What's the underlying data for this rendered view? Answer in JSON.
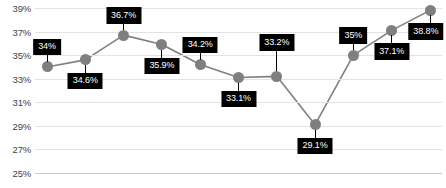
{
  "chart_data": {
    "type": "line",
    "title": "",
    "xlabel": "",
    "ylabel": "",
    "ylim": [
      25,
      39
    ],
    "grid": true,
    "legend": "none",
    "yticks": [
      "39%",
      "37%",
      "35%",
      "33%",
      "31%",
      "29%",
      "27%",
      "25%"
    ],
    "ytick_values": [
      39,
      37,
      35,
      33,
      31,
      29,
      27,
      25
    ],
    "categories": [
      "1",
      "2",
      "3",
      "4",
      "5",
      "6",
      "7",
      "8",
      "9",
      "10",
      "11"
    ],
    "values": [
      34,
      34.6,
      36.7,
      35.9,
      34.2,
      33.1,
      33.2,
      29.1,
      35,
      37.1,
      38.8
    ],
    "data_labels": [
      "34%",
      "34.6%",
      "36.7%",
      "35.9%",
      "34.2%",
      "33.1%",
      "33.2%",
      "29.1%",
      "35%",
      "37.1%",
      "38.8%"
    ],
    "label_placement": [
      "above",
      "below",
      "above",
      "below",
      "above",
      "below",
      "above-far",
      "below",
      "above",
      "below",
      "above"
    ],
    "colors": {
      "line": "#7f7f7f",
      "marker": "#7f7f7f",
      "label_background": "#000000",
      "label_text": "#ffffff",
      "gridline": "#e3e3e3",
      "axis": "#c9c9c9",
      "tick_text": "#3f3f3f",
      "plot_background": "#ffffff"
    }
  }
}
